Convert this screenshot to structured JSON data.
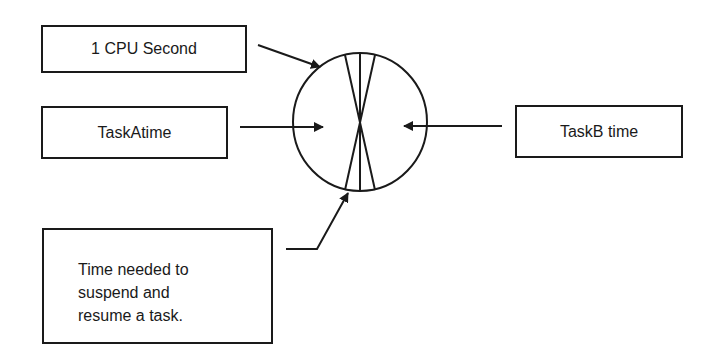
{
  "diagram": {
    "colors": {
      "stroke": "#1a1a1a",
      "background": "#ffffff"
    },
    "boxes": {
      "cpu_second": {
        "label": "1 CPU Second"
      },
      "task_a": {
        "label": "TaskAtime"
      },
      "task_b": {
        "label": "TaskB time"
      },
      "switch_overhead": {
        "lines": [
          "Time needed to",
          "suspend and",
          "resume a task."
        ]
      }
    },
    "circle": {
      "represents": "1 CPU Second",
      "center": [
        360,
        122
      ],
      "radius": 68,
      "segments": [
        "TaskA time",
        "context switch",
        "TaskB time",
        "context switch"
      ]
    },
    "arrows": [
      {
        "from": "cpu_second",
        "to": "circle-edge"
      },
      {
        "from": "task_a",
        "to": "left-segment"
      },
      {
        "from": "task_b",
        "to": "right-segment"
      },
      {
        "from": "switch_overhead",
        "to": "bottom-wedge"
      }
    ]
  }
}
